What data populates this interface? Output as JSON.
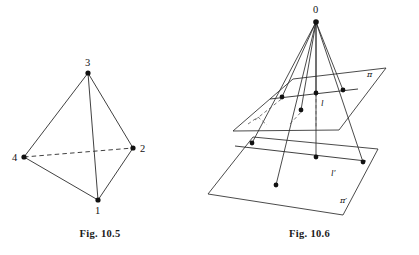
{
  "page": {
    "background": "#ffffff",
    "ink_color": "#2b2b2b",
    "width": 419,
    "height": 255
  },
  "figures": [
    {
      "id": "fig-10-5",
      "caption": "Fig. 10.5",
      "subject": "tetrahedron",
      "description": "Tetrahedron with four labelled vertices; edge 4-2 drawn dashed as a hidden edge.",
      "vertices": [
        {
          "label": "3",
          "x": 88,
          "y": 73,
          "label_x": 85,
          "label_y": 66
        },
        {
          "label": "2",
          "x": 133,
          "y": 148,
          "label_x": 140,
          "label_y": 152
        },
        {
          "label": "4",
          "x": 24,
          "y": 157,
          "label_x": 12,
          "label_y": 161
        },
        {
          "label": "1",
          "x": 98,
          "y": 200,
          "label_x": 95,
          "label_y": 214
        }
      ],
      "edges_solid": [
        {
          "from": "3",
          "to": "4"
        },
        {
          "from": "3",
          "to": "2"
        },
        {
          "from": "3",
          "to": "1"
        },
        {
          "from": "4",
          "to": "1"
        },
        {
          "from": "2",
          "to": "1"
        }
      ],
      "edges_dashed": [
        {
          "from": "4",
          "to": "2"
        }
      ]
    },
    {
      "id": "fig-10-6",
      "caption": "Fig. 10.6",
      "subject": "central-projection-between-two-planes",
      "description": "Point O above two parallel planes pi and pi-prime; four rays from O meet line l in plane pi and line l-prime in plane pi-prime.",
      "apex": {
        "label": "0",
        "x": 116,
        "y": 22,
        "label_x": 113,
        "label_y": 13
      },
      "plane_upper": {
        "label": "π",
        "label_x": 167,
        "label_y": 77,
        "corners": [
          {
            "x": 93,
            "y": 79
          },
          {
            "x": 186,
            "y": 68
          },
          {
            "x": 139,
            "y": 130
          },
          {
            "x": 33,
            "y": 131
          }
        ]
      },
      "plane_lower": {
        "label": "π′",
        "label_x": 140,
        "label_y": 203,
        "corners": [
          {
            "x": 53,
            "y": 137
          },
          {
            "x": 178,
            "y": 149
          },
          {
            "x": 143,
            "y": 215
          },
          {
            "x": 8,
            "y": 194
          }
        ]
      },
      "line_upper": {
        "label": "l",
        "label_x": 121,
        "label_y": 106,
        "from": {
          "x": 70,
          "y": 99
        },
        "to": {
          "x": 158,
          "y": 89
        }
      },
      "line_lower": {
        "label": "l′",
        "label_x": 131,
        "label_y": 176,
        "from": {
          "x": 35,
          "y": 146
        },
        "to": {
          "x": 166,
          "y": 161
        }
      },
      "points_upper": [
        {
          "x": 82,
          "y": 97
        },
        {
          "x": 116,
          "y": 93
        },
        {
          "x": 143,
          "y": 90
        },
        {
          "x": 101,
          "y": 110
        }
      ],
      "points_lower": [
        {
          "x": 52,
          "y": 143
        },
        {
          "x": 116,
          "y": 157
        },
        {
          "x": 163,
          "y": 162
        },
        {
          "x": 76,
          "y": 185
        }
      ],
      "rays": [
        {
          "from_apex": true,
          "to": {
            "x": 52,
            "y": 143
          },
          "through": {
            "x": 82,
            "y": 97
          }
        },
        {
          "from_apex": true,
          "to": {
            "x": 116,
            "y": 157
          },
          "through": {
            "x": 116,
            "y": 93
          }
        },
        {
          "from_apex": true,
          "to": {
            "x": 163,
            "y": 162
          },
          "through": {
            "x": 143,
            "y": 90
          }
        },
        {
          "from_apex": true,
          "to": {
            "x": 76,
            "y": 185
          },
          "through": {
            "x": 101,
            "y": 110
          }
        }
      ]
    }
  ]
}
